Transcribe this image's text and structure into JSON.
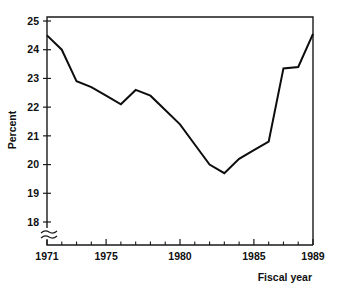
{
  "chart_data": {
    "type": "line",
    "title": "",
    "subtitle": "",
    "xlabel": "Fiscal year",
    "ylabel": "Percent",
    "xlim": [
      1971,
      1989
    ],
    "ylim": [
      18,
      25
    ],
    "grid": false,
    "legend": null,
    "axis_break": {
      "axis": "y",
      "note": "broken y-axis below 18",
      "symbol": "double-wave"
    },
    "x_tick_labels": [
      "1971",
      "1975",
      "1980",
      "1985",
      "1989"
    ],
    "x_tick_values": [
      1971,
      1975,
      1980,
      1985,
      1989
    ],
    "x_minor_tick_values": [
      1971,
      1972,
      1973,
      1974,
      1975,
      1976,
      1977,
      1978,
      1979,
      1980,
      1981,
      1982,
      1983,
      1984,
      1985,
      1986,
      1987,
      1988,
      1989
    ],
    "y_tick_labels": [
      "18",
      "19",
      "20",
      "21",
      "22",
      "23",
      "24",
      "25"
    ],
    "y_tick_values": [
      18,
      19,
      20,
      21,
      22,
      23,
      24,
      25
    ],
    "series": [
      {
        "name": "Percent",
        "color": "#0d0d0d",
        "x": [
          1971,
          1972,
          1973,
          1974,
          1975,
          1976,
          1977,
          1978,
          1979,
          1980,
          1981,
          1982,
          1983,
          1984,
          1985,
          1986,
          1987,
          1988,
          1989
        ],
        "values": [
          24.5,
          24.0,
          22.9,
          22.7,
          22.4,
          22.1,
          22.6,
          22.4,
          21.9,
          21.4,
          20.7,
          20.0,
          19.7,
          20.2,
          20.5,
          20.8,
          23.35,
          23.4,
          24.55
        ]
      }
    ]
  },
  "labels": {
    "y_axis_title": "Percent",
    "x_axis_title": "Fiscal year"
  }
}
